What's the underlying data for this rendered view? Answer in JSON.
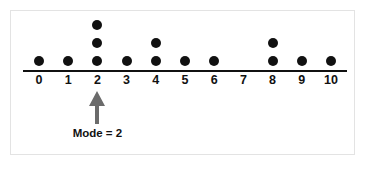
{
  "chart_data": {
    "type": "dotplot",
    "title": "",
    "xlabel": "",
    "ylabel": "",
    "categories": [
      "0",
      "1",
      "2",
      "3",
      "4",
      "5",
      "6",
      "7",
      "8",
      "9",
      "10"
    ],
    "values": [
      1,
      1,
      3,
      1,
      2,
      1,
      1,
      0,
      2,
      1,
      1
    ],
    "xlim": [
      0,
      10
    ],
    "grid": false,
    "legend": null,
    "dot_color": "#111111",
    "axis_color": "#111111",
    "annotations": [
      {
        "name": "mode-annotation",
        "text": "Mode = 2",
        "points_to_category": "2",
        "arrow_color": "#6b6b6b",
        "text_color": "#111111"
      }
    ]
  },
  "panel": {
    "background": "#ffffff",
    "border_color": "#e3e3e3"
  },
  "icons": {
    "up_arrow": "up-arrow-icon"
  }
}
